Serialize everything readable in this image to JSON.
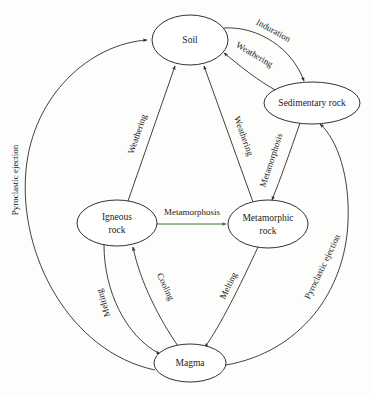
{
  "diagram": {
    "nodes": [
      {
        "id": "soil",
        "label": "Soil",
        "line1": "Soil",
        "line2": "",
        "cx": 190,
        "cy": 40,
        "rx": 38,
        "ry": 25
      },
      {
        "id": "sedimentary",
        "label": "Sedimentary rock",
        "line1": "Sedimentary",
        "line2": "rock",
        "cx": 312,
        "cy": 103,
        "rx": 48,
        "ry": 21
      },
      {
        "id": "igneous",
        "label": "Igneous rock",
        "line1": "Igneous",
        "line2": "rock",
        "cx": 117,
        "cy": 223,
        "rx": 40,
        "ry": 23
      },
      {
        "id": "metamorphic",
        "label": "Metamorphic rock",
        "line1": "Metamorphic",
        "line2": "rock",
        "cx": 268,
        "cy": 224,
        "rx": 40,
        "ry": 24
      },
      {
        "id": "magma",
        "label": "Magma",
        "line1": "Magma",
        "line2": "",
        "cx": 190,
        "cy": 363,
        "rx": 36,
        "ry": 19
      }
    ],
    "edges": [
      {
        "id": "soil-to-sedimentary",
        "label": "Induration",
        "from": "soil",
        "to": "sedimentary",
        "color": "#2b2b2b"
      },
      {
        "id": "sedimentary-to-soil",
        "label": "Weathering",
        "from": "sedimentary",
        "to": "soil",
        "color": "#2b2b2b"
      },
      {
        "id": "sedimentary-to-metamorphic",
        "label": "Metamorphosis",
        "from": "sedimentary",
        "to": "metamorphic",
        "color": "#2b2b2b"
      },
      {
        "id": "igneous-to-metamorphic",
        "label": "Metamorphosis",
        "from": "igneous",
        "to": "metamorphic",
        "color": "#2f7d32"
      },
      {
        "id": "igneous-to-soil",
        "label": "Weathering",
        "from": "igneous",
        "to": "soil",
        "color": "#2b2b2b"
      },
      {
        "id": "metamorphic-to-soil",
        "label": "Weathering",
        "from": "metamorphic",
        "to": "soil",
        "color": "#2b2b2b"
      },
      {
        "id": "igneous-to-magma",
        "label": "Melting",
        "from": "igneous",
        "to": "magma",
        "color": "#2b2b2b"
      },
      {
        "id": "magma-to-igneous",
        "label": "Cooling",
        "from": "magma",
        "to": "igneous",
        "color": "#2b2b2b"
      },
      {
        "id": "metamorphic-to-magma",
        "label": "Melting",
        "from": "metamorphic",
        "to": "magma",
        "color": "#2b2b2b"
      },
      {
        "id": "magma-to-soil",
        "label": "Pyroclastic ejection",
        "from": "magma",
        "to": "soil",
        "color": "#2b2b2b"
      },
      {
        "id": "magma-to-sedimentary",
        "label": "Pyroclastic ejection",
        "from": "magma",
        "to": "sedimentary",
        "color": "#2b2b2b"
      }
    ]
  }
}
